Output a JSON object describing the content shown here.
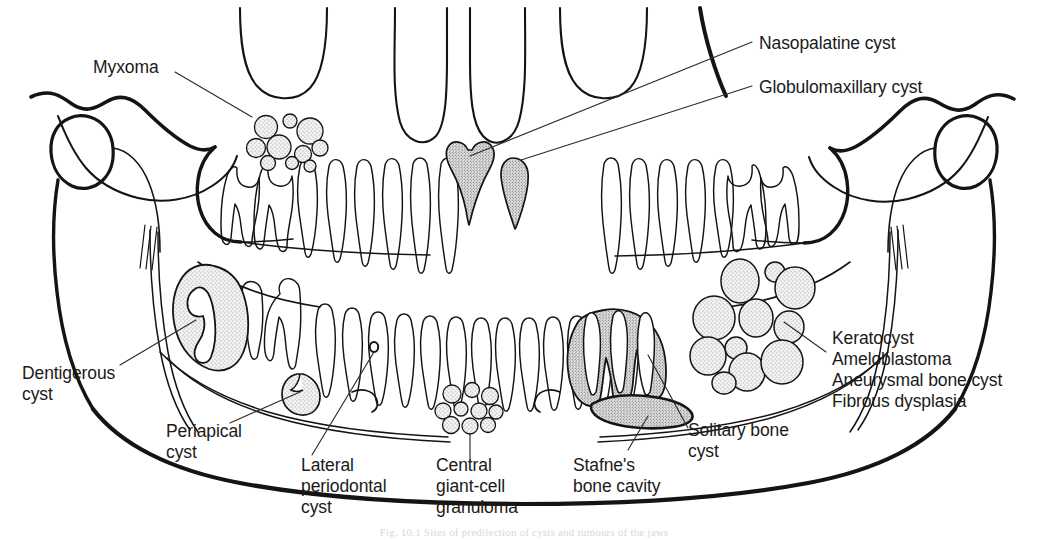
{
  "figure": {
    "caption": "Fig. 10.1 Sites of predilection of cysts and tumours of the jaws"
  },
  "labels": {
    "myxoma": "Myxoma",
    "nasopalatine_cyst": "Nasopalatine cyst",
    "globulomaxillary_cyst": "Globulomaxillary cyst",
    "dentigerous_cyst": "Dentigerous\ncyst",
    "periapical_cyst": "Periapical\ncyst",
    "lateral_periodontal_cyst": "Lateral\nperiodontal\ncyst",
    "central_giant_cell_granuloma": "Central\ngiant-cell\ngranuloma",
    "stafnes_bone_cavity": "Stafne's\nbone cavity",
    "solitary_bone_cyst": "Solitary bone\ncyst",
    "right_block": "Keratocyst\nAmeloblastoma\nAneurysmal bone cyst\nFibrous dysplasia"
  },
  "right_block_lines": [
    "Keratocyst",
    "Ameloblastoma",
    "Aneurysmal bone cyst",
    "Fibrous dysplasia"
  ],
  "colors": {
    "ink": "#141414",
    "paper": "#ffffff",
    "stipple": "#5a5a5a",
    "leader": "#303030"
  },
  "lesions": [
    {
      "name": "myxoma",
      "description": "multilocular soap-bubble lesion in left maxillary tuberosity region"
    },
    {
      "name": "nasopalatine-cyst",
      "description": "heart-shaped radiolucency in midline between central incisors"
    },
    {
      "name": "globulomaxillary-cyst",
      "description": "pear-shaped radiolucency between lateral incisor and canine"
    },
    {
      "name": "dentigerous-cyst",
      "description": "large pericoronal radiolucency around unerupted molar in left mandibular ramus"
    },
    {
      "name": "periapical-cyst",
      "description": "round radiolucency at apex of mandibular premolar"
    },
    {
      "name": "lateral-periodontal-cyst",
      "description": "small oval radiolucency lateral to mandibular root"
    },
    {
      "name": "central-giant-cell-granuloma",
      "description": "multilocular lesion anterior mandible below incisors"
    },
    {
      "name": "stafnes-bone-cavity",
      "description": "elongate radiolucency below mandibular canal posteriorly"
    },
    {
      "name": "solitary-bone-cyst",
      "description": "scalloped radiolucency between molar roots"
    },
    {
      "name": "keratocyst-group",
      "description": "large multilocular lesion in right mandibular angle and ramus"
    }
  ]
}
